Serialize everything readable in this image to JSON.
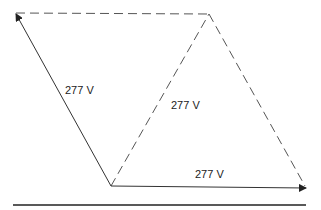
{
  "diagram": {
    "type": "phasor-triangle",
    "colors": {
      "solid": "#333333",
      "dashed": "#555555",
      "text": "#222222",
      "background": "#ffffff"
    },
    "labels": {
      "left_phasor": "277 V",
      "center": "277 V",
      "bottom_phasor": "277 V"
    }
  }
}
